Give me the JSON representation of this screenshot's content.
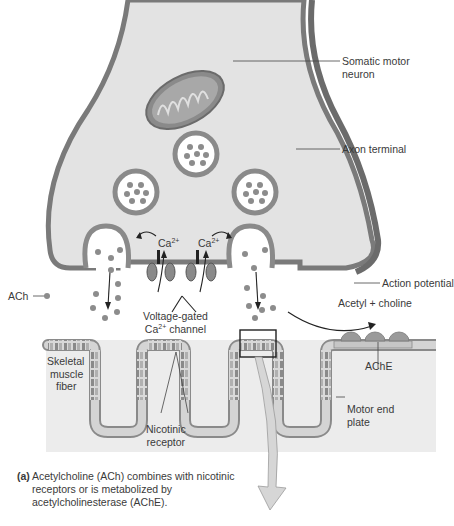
{
  "figure": {
    "labels": {
      "somatic_motor_neuron": [
        "Somatic motor",
        "neuron"
      ],
      "axon_terminal": "Axon terminal",
      "action_potential": "Action potential",
      "ach": "ACh",
      "ca_left": "Ca",
      "ca_right": "Ca",
      "ca_superscript": "2+",
      "voltage_gated_line1": "Voltage-gated",
      "voltage_gated_line2_prefix": "Ca",
      "voltage_gated_line2_sup": "2+",
      "voltage_gated_line2_suffix": " channel",
      "acetyl_choline": "Acetyl + choline",
      "ache": "AChE",
      "skeletal_muscle_fiber": [
        "Skeletal",
        "muscle",
        "fiber"
      ],
      "nicotinic_receptor": [
        "Nicotinic",
        "receptor"
      ],
      "motor_end_plate": [
        "Motor end",
        "plate"
      ]
    },
    "caption": {
      "tag": "(a)",
      "text": "Acetylcholine (ACh) combines with nicotinic receptors or is metabolized by acetylcholinesterase (AChE)."
    },
    "colors": {
      "membrane_dark": "#6b6b6b",
      "membrane_mid": "#8a8a8a",
      "cytoplasm": "#e3e3e3",
      "vesicle_fill": "#ffffff",
      "ach_dot": "#8c8c8c",
      "muscle_fill": "#ececec",
      "muscle_membrane": "#c9c9c9",
      "arrow_fill": "#d6d6d6",
      "text": "#3a3a3a"
    }
  }
}
